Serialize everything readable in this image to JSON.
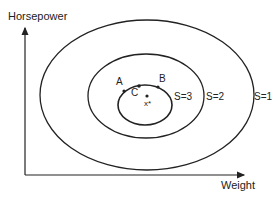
{
  "axes": {
    "y_label": "Horsepower",
    "x_label": "Weight"
  },
  "contours": [
    {
      "label": "S=1",
      "cx": 147,
      "cy": 95,
      "rx": 107,
      "ry": 75
    },
    {
      "label": "S=2",
      "cx": 146,
      "cy": 96,
      "rx": 58,
      "ry": 42
    },
    {
      "label": "S=3",
      "cx": 145,
      "cy": 105,
      "rx": 27,
      "ry": 20
    }
  ],
  "points": {
    "A": "A",
    "B": "B",
    "C": "C",
    "x_star": "x*"
  },
  "colors": {
    "stroke": "#222222",
    "background": "#ffffff"
  }
}
